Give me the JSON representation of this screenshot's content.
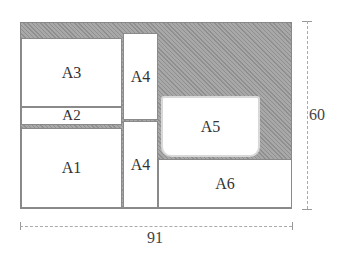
{
  "diagram": {
    "regions": [
      {
        "id": "A1",
        "label": "A1"
      },
      {
        "id": "A2",
        "label": "A2"
      },
      {
        "id": "A3",
        "label": "A3"
      },
      {
        "id": "A4_top",
        "label": "A4"
      },
      {
        "id": "A4_bottom",
        "label": "A4"
      },
      {
        "id": "A5",
        "label": "A5"
      },
      {
        "id": "A6",
        "label": "A6"
      }
    ],
    "dimensions": {
      "width": "91",
      "height": "60"
    },
    "colors": {
      "background_fill": "#9a9a9a",
      "region_fill": "#ffffff"
    }
  }
}
